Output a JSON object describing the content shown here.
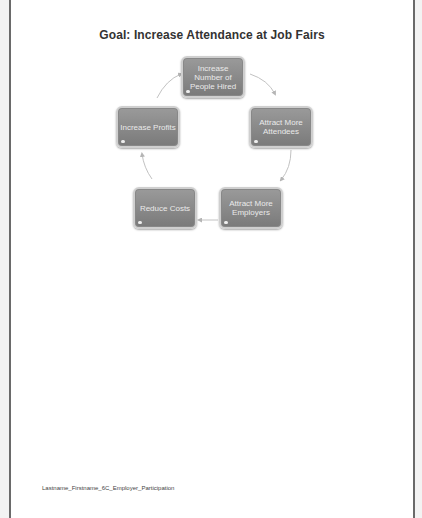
{
  "document": {
    "title": "Goal: Increase Attendance at Job Fairs",
    "footer": "Lastname_Firstname_6C_Employer_Participation"
  },
  "cycle": {
    "nodes": [
      {
        "label": "Increase Number of People Hired"
      },
      {
        "label": "Attract More Attendees"
      },
      {
        "label": "Attract More Employers"
      },
      {
        "label": "Reduce Costs"
      },
      {
        "label": "Increase Profits"
      }
    ],
    "colors": {
      "node_fill": "#8a8a8a",
      "node_border": "#cfcfcf",
      "node_text": "#eaeaea",
      "arrow": "#b5b5b5"
    }
  }
}
